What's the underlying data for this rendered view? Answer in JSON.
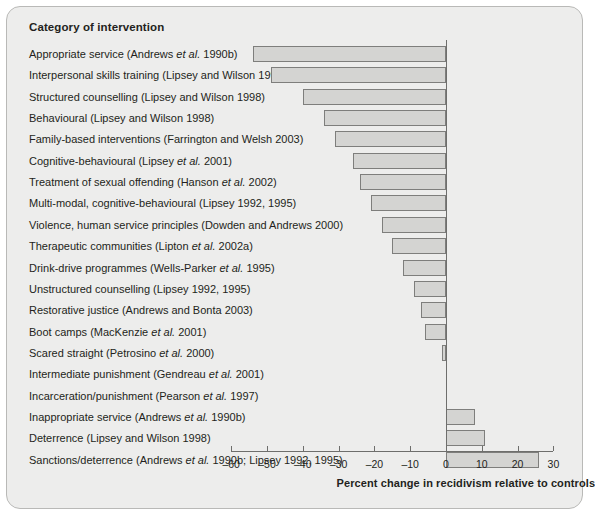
{
  "figure": {
    "column_header": "Category of intervention",
    "panel_bg": "#ededec",
    "bar_fill": "#d4d4d2",
    "bar_stroke": "#7e7e7c"
  },
  "chart_data": {
    "type": "bar",
    "orientation": "horizontal",
    "title": "",
    "subtitle": "",
    "xlabel": "Percent change in recidivism relative to controls",
    "ylabel": "Category of intervention",
    "xlim": [
      -60,
      30
    ],
    "xticks": [
      -60,
      -50,
      -40,
      -30,
      -20,
      -10,
      0,
      10,
      20,
      30
    ],
    "xticklabels": [
      "–60",
      "–50",
      "–40",
      "–30",
      "–20",
      "–10",
      "0",
      "10",
      "20",
      "30"
    ],
    "grid": false,
    "legend": null,
    "categories": [
      "Appropriate service (Andrews et al. 1990b)",
      "Interpersonal skills training (Lipsey and Wilson 1998)",
      "Structured counselling (Lipsey and Wilson 1998)",
      "Behavioural (Lipsey and Wilson 1998)",
      "Family-based interventions (Farrington and Welsh 2003)",
      "Cognitive-behavioural (Lipsey et al. 2001)",
      "Treatment of sexual offending (Hanson et al. 2002)",
      "Multi-modal, cognitive-behavioural (Lipsey 1992, 1995)",
      "Violence, human service principles (Dowden and Andrews 2000)",
      "Therapeutic communities (Lipton et al. 2002a)",
      "Drink-drive programmes (Wells-Parker et al. 1995)",
      "Unstructured counselling (Lipsey 1992, 1995)",
      "Restorative justice (Andrews and Bonta 2003)",
      "Boot camps (MacKenzie et al. 2001)",
      "Scared straight (Petrosino et al. 2000)",
      "Intermediate punishment (Gendreau et al. 2001)",
      "Incarceration/punishment (Pearson et al. 1997)",
      "Inappropriate service (Andrews et al. 1990b)",
      "Deterrence (Lipsey and Wilson 1998)",
      "Sanctions/deterrence (Andrews et al. 1990b; Lipsey 1992, 1995)"
    ],
    "values": [
      -54,
      -49,
      -40,
      -34,
      -31,
      -26,
      -24,
      -21,
      -18,
      -15,
      -12,
      -9,
      -7,
      -6,
      -1,
      0,
      0,
      8,
      11,
      26
    ]
  },
  "rows": [
    {
      "label_pre": "Appropriate service (Andrews ",
      "label_it": "et al.",
      "label_post": " 1990b)",
      "value": -54
    },
    {
      "label_pre": "Interpersonal skills training (Lipsey and Wilson 1998)",
      "label_it": "",
      "label_post": "",
      "value": -49
    },
    {
      "label_pre": "Structured counselling (Lipsey and Wilson 1998)",
      "label_it": "",
      "label_post": "",
      "value": -40
    },
    {
      "label_pre": "Behavioural (Lipsey and Wilson 1998)",
      "label_it": "",
      "label_post": "",
      "value": -34
    },
    {
      "label_pre": "Family-based interventions (Farrington and Welsh 2003)",
      "label_it": "",
      "label_post": "",
      "value": -31
    },
    {
      "label_pre": "Cognitive-behavioural (Lipsey ",
      "label_it": "et al.",
      "label_post": " 2001)",
      "value": -26
    },
    {
      "label_pre": "Treatment of sexual offending (Hanson ",
      "label_it": "et al.",
      "label_post": " 2002)",
      "value": -24
    },
    {
      "label_pre": "Multi-modal, cognitive-behavioural (Lipsey 1992, 1995)",
      "label_it": "",
      "label_post": "",
      "value": -21
    },
    {
      "label_pre": "Violence, human service principles (Dowden and Andrews 2000)",
      "label_it": "",
      "label_post": "",
      "value": -18
    },
    {
      "label_pre": "Therapeutic communities (Lipton ",
      "label_it": "et al.",
      "label_post": " 2002a)",
      "value": -15
    },
    {
      "label_pre": "Drink-drive programmes (Wells-Parker ",
      "label_it": "et al.",
      "label_post": " 1995)",
      "value": -12
    },
    {
      "label_pre": "Unstructured counselling (Lipsey 1992, 1995)",
      "label_it": "",
      "label_post": "",
      "value": -9
    },
    {
      "label_pre": "Restorative justice (Andrews and Bonta 2003)",
      "label_it": "",
      "label_post": "",
      "value": -7
    },
    {
      "label_pre": "Boot camps (MacKenzie ",
      "label_it": "et al.",
      "label_post": " 2001)",
      "value": -6
    },
    {
      "label_pre": "Scared straight (Petrosino ",
      "label_it": "et al.",
      "label_post": " 2000)",
      "value": -1
    },
    {
      "label_pre": "Intermediate punishment (Gendreau ",
      "label_it": "et al.",
      "label_post": " 2001)",
      "value": 0
    },
    {
      "label_pre": "Incarceration/punishment (Pearson ",
      "label_it": "et al.",
      "label_post": " 1997)",
      "value": 0
    },
    {
      "label_pre": "Inappropriate service (Andrews ",
      "label_it": "et al.",
      "label_post": " 1990b)",
      "value": 8
    },
    {
      "label_pre": "Deterrence (Lipsey and Wilson 1998)",
      "label_it": "",
      "label_post": "",
      "value": 11
    },
    {
      "label_pre": "Sanctions/deterrence (Andrews ",
      "label_it": "et al.",
      "label_post": " 1990b; Lipsey 1992, 1995)",
      "value": 26
    }
  ]
}
